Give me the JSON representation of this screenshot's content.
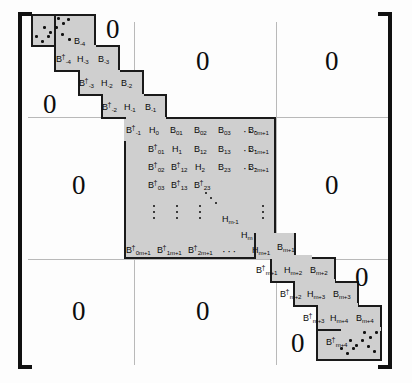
{
  "figure": {
    "kind": "block-tridiagonal-matrix",
    "shaded_color": "#cfcfcf",
    "line_color": "#1a1a1a",
    "rule_color": "#b9b9b9",
    "zero_glyph": "0",
    "hdots_glyph": "···"
  },
  "zeros": {
    "top_left": "0",
    "top_middle_upper": "0",
    "top_middle_large": "0",
    "top_right": "0",
    "middle_left": "0",
    "middle_right": "0",
    "bottom_left": "0",
    "bottom_middle": "0",
    "bottom_right_upper": "0",
    "bottom_right_lower": "0"
  },
  "top_staircase": {
    "rows": [
      {
        "b_upper": "B",
        "b_upper_sub": "-4"
      },
      {
        "b_dag": "B",
        "b_dag_sub": "-4",
        "h": "H",
        "h_sub": "-3",
        "b": "B",
        "b_sub": "-3"
      },
      {
        "b_dag": "B",
        "b_dag_sub": "-3",
        "h": "H",
        "h_sub": "-2",
        "b": "B",
        "b_sub": "-2"
      },
      {
        "b_dag": "B",
        "b_dag_sub": "-2",
        "h": "H",
        "h_sub": "-1",
        "b": "B",
        "b_sub": "-1"
      },
      {
        "b_dag": "B",
        "b_dag_sub": "-1"
      }
    ]
  },
  "dense_block": {
    "row0": [
      "H",
      "B",
      "B",
      "B"
    ],
    "row0_subs": [
      "0",
      "01",
      "02",
      "03"
    ],
    "row0_last": "B",
    "row0_last_sub": "0m+1",
    "row1": [
      "B",
      "H",
      "B",
      "B"
    ],
    "row1_subs": [
      "01",
      "1",
      "12",
      "13"
    ],
    "row1_last": "B",
    "row1_last_sub": "1m+1",
    "row2": [
      "B",
      "B",
      "H",
      "B"
    ],
    "row2_subs": [
      "02",
      "12",
      "2",
      "23"
    ],
    "row2_last": "B",
    "row2_last_sub": "2m+1",
    "row3": [
      "B",
      "B",
      "B"
    ],
    "row3_subs": [
      "03",
      "13",
      "23"
    ],
    "diag_mid": "H",
    "diag_mid_sub": "m-1",
    "diag_low": "H",
    "diag_low_sub": "m",
    "last_row": [
      "B",
      "B",
      "B"
    ],
    "last_row_subs": [
      "0m+1",
      "1m+1",
      "2m+1"
    ],
    "last_row_h": "H",
    "last_row_h_sub": "m+1",
    "dagger": "†"
  },
  "bottom_staircase": {
    "rows": [
      {
        "b": "B",
        "b_sub": "m+1"
      },
      {
        "b_dag": "B",
        "b_dag_sub": "m+1",
        "h": "H",
        "h_sub": "m+2",
        "b": "B",
        "b_sub": "m+2"
      },
      {
        "b_dag": "B",
        "b_dag_sub": "m+2",
        "h": "H",
        "h_sub": "m+3",
        "b": "B",
        "b_sub": "m+3"
      },
      {
        "b_dag": "B",
        "b_dag_sub": "m+3",
        "h": "H",
        "h_sub": "m+4",
        "b": "B",
        "b_sub": "m+4"
      },
      {
        "b_dag": "B",
        "b_dag_sub": "m+4"
      }
    ]
  }
}
